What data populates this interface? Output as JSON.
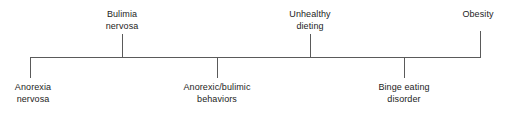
{
  "diagram": {
    "type": "continuum",
    "orientation": "horizontal",
    "axis": {
      "color": "#5a5a5a",
      "start_x": 30,
      "end_x": 480,
      "y": 57
    },
    "nodes": [
      {
        "id": "anorexia-nervosa",
        "position": "below",
        "x": 30,
        "connector_kind": "corner-left",
        "lines": [
          "Anorexia",
          "nervosa"
        ]
      },
      {
        "id": "bulimia-nervosa",
        "position": "above",
        "x": 122,
        "connector_kind": "tick",
        "lines": [
          "Bulimia",
          "nervosa"
        ]
      },
      {
        "id": "anorexic-bulimic-behaviors",
        "position": "below",
        "x": 217,
        "connector_kind": "tick",
        "lines": [
          "Anorexic/bulimic",
          "behaviors"
        ]
      },
      {
        "id": "unhealthy-dieting",
        "position": "above",
        "x": 310,
        "connector_kind": "tick",
        "lines": [
          "Unhealthy",
          "dieting"
        ]
      },
      {
        "id": "binge-eating-disorder",
        "position": "below",
        "x": 404,
        "connector_kind": "tick",
        "lines": [
          "Binge eating",
          "disorder"
        ]
      },
      {
        "id": "obesity",
        "position": "above",
        "x": 480,
        "connector_kind": "corner-right",
        "lines": [
          "Obesity"
        ]
      }
    ]
  }
}
